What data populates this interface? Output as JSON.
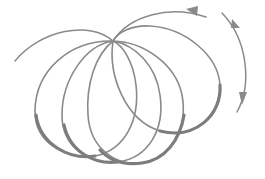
{
  "diagram": {
    "title": "",
    "colors": {
      "background": "#ffffff",
      "stroke": "#8a8a8a",
      "stroke_dark": "#7d7d7d"
    },
    "common_point": {
      "x": 113,
      "y": 41
    },
    "loops": [
      {
        "id": "loop-1",
        "left": 35,
        "right": 137,
        "bottom": 158
      },
      {
        "id": "loop-2",
        "left": 62,
        "right": 162,
        "bottom": 163
      },
      {
        "id": "loop-3",
        "left": 87,
        "right": 185,
        "bottom": 165
      },
      {
        "id": "loop-4",
        "left": 110,
        "right": 221,
        "bottom": 132
      }
    ],
    "arrows": [
      {
        "id": "top-arc-arrow",
        "direction": "left"
      },
      {
        "id": "right-arc-arrow-up",
        "direction": "up"
      },
      {
        "id": "right-arc-arrow-down",
        "direction": "down"
      }
    ]
  }
}
